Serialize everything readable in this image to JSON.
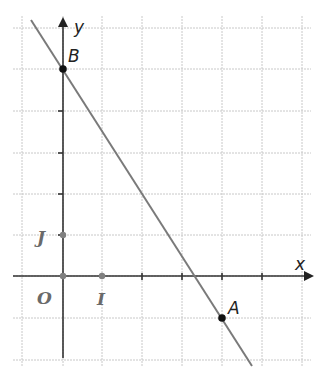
{
  "figure": {
    "type": "coordinate-plane",
    "axes": {
      "x_label": "x",
      "y_label": "y",
      "origin_label": "O",
      "unit_x_label": "I",
      "unit_y_label": "J"
    },
    "points": [
      {
        "name": "B",
        "x": 0,
        "y": 5
      },
      {
        "name": "A",
        "x": 4,
        "y": -1
      }
    ],
    "line": {
      "through": [
        "B",
        "A"
      ],
      "color": "#7a7a7a"
    },
    "colors": {
      "grid": "#c8c8c8",
      "axis": "#333333",
      "point": "#111111",
      "unit_points": "#808080"
    }
  }
}
